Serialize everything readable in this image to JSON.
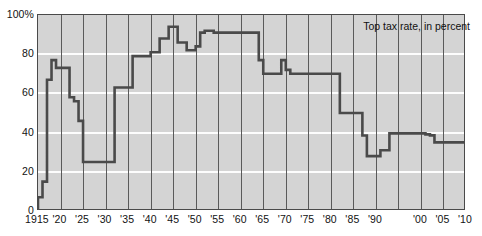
{
  "chart_data": {
    "type": "line",
    "line_style": "step",
    "title": "",
    "subtitle": "",
    "annotation": "Top tax rate, in percent",
    "xlabel": "",
    "ylabel": "",
    "xlim": [
      1915,
      2010
    ],
    "ylim": [
      0,
      100
    ],
    "grid": "horizontal-white-and-vertical-dark",
    "legend_position": "top-right-inside",
    "y_ticks": [
      0,
      20,
      40,
      60,
      80,
      100
    ],
    "y_tick_labels": [
      "0",
      "20",
      "40",
      "60",
      "80",
      "100%"
    ],
    "x_ticks": [
      1915,
      1920,
      1925,
      1930,
      1935,
      1940,
      1945,
      1950,
      1955,
      1960,
      1965,
      1970,
      1975,
      1980,
      1985,
      1990,
      2000,
      2005,
      2010
    ],
    "x_tick_labels": [
      "1915",
      "'20",
      "'25",
      "'30",
      "'35",
      "'40",
      "'45",
      "'50",
      "'55",
      "'60",
      "'65",
      "'70",
      "'75",
      "'80",
      "'85",
      "'90",
      "'00",
      "'05",
      "'10"
    ],
    "series": [
      {
        "name": "Top tax rate, in percent",
        "color": "#4a4a4a",
        "x": [
          1915,
          1916,
          1917,
          1918,
          1919,
          1921,
          1922,
          1923,
          1924,
          1925,
          1932,
          1936,
          1940,
          1941,
          1942,
          1944,
          1946,
          1948,
          1950,
          1951,
          1952,
          1954,
          1964,
          1965,
          1969,
          1970,
          1971,
          1982,
          1987,
          1988,
          1991,
          1993,
          2001,
          2002,
          2003,
          2010
        ],
        "values": [
          7,
          15,
          67,
          77,
          73,
          73,
          58,
          56,
          46,
          25,
          63,
          79,
          81,
          81,
          88,
          94,
          86,
          82,
          84,
          91,
          92,
          91,
          77,
          70,
          77,
          72,
          70,
          50,
          38.5,
          28,
          31,
          39.6,
          39.1,
          38.6,
          35,
          35
        ]
      }
    ]
  },
  "axes": {
    "y_labels": [
      "100%",
      "80",
      "60",
      "40",
      "20",
      "0"
    ],
    "x_labels": [
      "1915",
      "'20",
      "'25",
      "'30",
      "'35",
      "'40",
      "'45",
      "'50",
      "'55",
      "'60",
      "'65",
      "'70",
      "'75",
      "'80",
      "'85",
      "'90",
      "'00",
      "'05",
      "'10"
    ]
  },
  "annotation": {
    "text": "Top tax rate, in percent"
  },
  "colors": {
    "plot_background": "#d4d4d4",
    "gridline_horizontal": "#fdfdfd",
    "gridline_vertical": "#5a5a5a",
    "series_line": "#4a4a4a",
    "frame": "#4a4a4a",
    "text": "#121212",
    "page_background": "#ffffff"
  }
}
